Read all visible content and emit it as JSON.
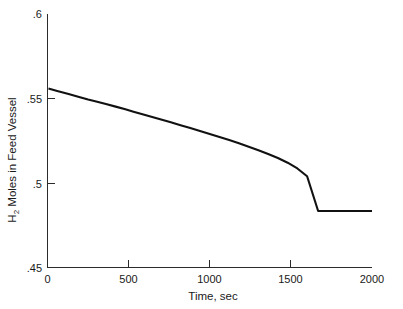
{
  "chart_data": {
    "type": "line",
    "title": "",
    "subtitle": "",
    "xlabel": "Time, sec",
    "ylabel": "H2 Moles in Feed Vessel",
    "ylabel_prefix": "H",
    "ylabel_subscript": "2",
    "ylabel_suffix": " Moles in Feed Vessel",
    "xlim": [
      0,
      2000
    ],
    "ylim": [
      0.45,
      0.6
    ],
    "xticks": [
      0,
      500,
      1000,
      1500,
      2000
    ],
    "xtick_labels": [
      "0",
      "500",
      "1000",
      "1500",
      "2000"
    ],
    "yticks": [
      0.45,
      0.5,
      0.55,
      0.6
    ],
    "ytick_labels": [
      ".45",
      ".5",
      ".55",
      ".6"
    ],
    "grid": false,
    "legend": null,
    "legend_position": "none",
    "line_color": "#111111",
    "axis_color": "#2b2b2b",
    "background_color": "#ffffff",
    "series": [
      {
        "name": "H2 moles in feed vessel",
        "x": [
          6,
          60,
          130,
          200,
          250,
          300,
          360,
          420,
          480,
          530,
          580,
          640,
          700,
          760,
          820,
          880,
          940,
          1000,
          1060,
          1120,
          1180,
          1240,
          1300,
          1360,
          1420,
          1480,
          1540,
          1600,
          1668,
          1720,
          1800,
          1900,
          2000
        ],
        "y": [
          0.5559,
          0.5545,
          0.5527,
          0.5508,
          0.5494,
          0.5482,
          0.5467,
          0.5452,
          0.5436,
          0.5422,
          0.5408,
          0.5392,
          0.5376,
          0.5359,
          0.5342,
          0.5325,
          0.5308,
          0.529,
          0.5272,
          0.5254,
          0.5235,
          0.5215,
          0.5194,
          0.5172,
          0.5148,
          0.512,
          0.5086,
          0.504,
          0.4834,
          0.4834,
          0.4834,
          0.4834,
          0.4834
        ]
      }
    ],
    "annotations": [
      {
        "text": "plateau begins",
        "x": 1668,
        "y": 0.4834
      }
    ]
  }
}
